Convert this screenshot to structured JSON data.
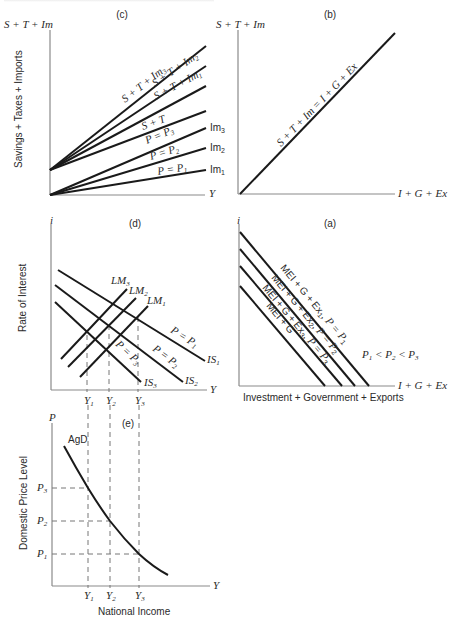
{
  "figure": {
    "panel_c": {
      "label": "(c)",
      "y_axis_title": "S + T + Im",
      "y_axis_label": "Savings + Taxes + Imports",
      "x_axis_title": "Y",
      "lines": [
        {
          "label": "S + T + Im",
          "sub": "3"
        },
        {
          "label": "S + T + Im",
          "sub": "2"
        },
        {
          "label": "S + T + Im",
          "sub": "1"
        },
        {
          "label": "S + T",
          "sub": ""
        },
        {
          "label": "P = P",
          "sub": "3",
          "end_label": "Im",
          "end_sub": "3"
        },
        {
          "label": "P = P",
          "sub": "2",
          "end_label": "Im",
          "end_sub": "2"
        },
        {
          "label": "P = P",
          "sub": "1",
          "end_label": "Im",
          "end_sub": "1"
        }
      ]
    },
    "panel_b": {
      "label": "(b)",
      "y_axis_title": "S + T + Im",
      "x_axis_title": "I + G + Ex",
      "line_label": "S + T + Im = I + G + Ex"
    },
    "panel_d": {
      "label": "(d)",
      "y_axis_title": "i",
      "y_axis_label": "Rate of Interest",
      "x_axis_title": "Y",
      "lm": [
        {
          "label": "LM",
          "sub": "3"
        },
        {
          "label": "LM",
          "sub": "2"
        },
        {
          "label": "LM",
          "sub": "1"
        }
      ],
      "is": [
        {
          "label": "IS",
          "sub": "1",
          "price": "P = P",
          "price_sub": "1"
        },
        {
          "label": "IS",
          "sub": "2",
          "price": "P = P",
          "price_sub": "2"
        },
        {
          "label": "IS",
          "sub": "3",
          "price": "P = P",
          "price_sub": "3"
        }
      ],
      "x_ticks": [
        {
          "label": "Y",
          "sub": "1"
        },
        {
          "label": "Y",
          "sub": "2"
        },
        {
          "label": "Y",
          "sub": "3"
        }
      ]
    },
    "panel_a": {
      "label": "(a)",
      "y_axis_title": "i",
      "x_axis_title": "I + G + Ex",
      "x_axis_label": "Investment + Government + Exports",
      "lines": [
        {
          "label": "MEI + G + Ex",
          "sub": "1",
          "price": ", P = P",
          "price_sub": "1"
        },
        {
          "label": "MEI + G + Ex",
          "sub": "2",
          "price": ", P = P",
          "price_sub": "2"
        },
        {
          "label": "MEI + G + Ex",
          "sub": "3",
          "price": ", P = P",
          "price_sub": "3"
        },
        {
          "label": "MEI + G",
          "sub": "",
          "price": "",
          "price_sub": ""
        }
      ],
      "note": {
        "p1": "P",
        "s1": "1",
        "lt1": " < ",
        "p2": "P",
        "s2": "2",
        "lt2": " < ",
        "p3": "P",
        "s3": "3"
      }
    },
    "panel_e": {
      "label": "(e)",
      "y_axis_title": "P",
      "y_axis_label": "Domestic Price Level",
      "x_axis_title": "Y",
      "x_axis_label": "National Income",
      "curve_label": "AgD",
      "y_ticks": [
        {
          "label": "P",
          "sub": "3"
        },
        {
          "label": "P",
          "sub": "2"
        },
        {
          "label": "P",
          "sub": "1"
        }
      ],
      "x_ticks": [
        {
          "label": "Y",
          "sub": "1"
        },
        {
          "label": "Y",
          "sub": "2"
        },
        {
          "label": "Y",
          "sub": "3"
        }
      ]
    }
  }
}
